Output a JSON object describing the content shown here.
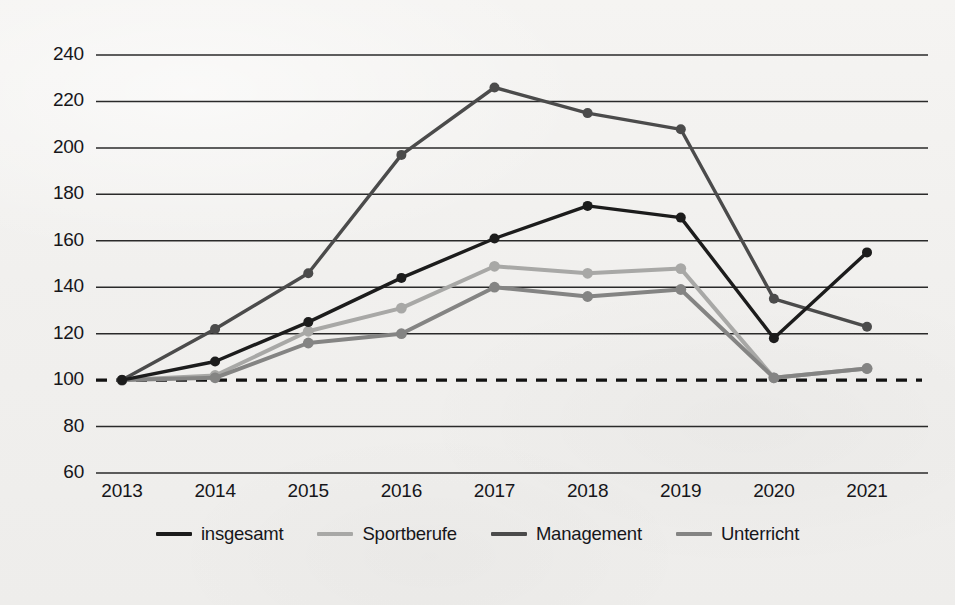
{
  "chart_data": {
    "type": "line",
    "title": "",
    "subtitle": "",
    "xlabel": "",
    "ylabel": "",
    "categories": [
      "2013",
      "2014",
      "2015",
      "2016",
      "2017",
      "2018",
      "2019",
      "2020",
      "2021"
    ],
    "ylim": [
      60,
      240
    ],
    "ytick_step": 20,
    "yticks": [
      60,
      80,
      100,
      120,
      140,
      160,
      180,
      200,
      220,
      240
    ],
    "grid": true,
    "grid_orientation": "horizontal",
    "reference_line": {
      "value": 100,
      "style": "dashed",
      "label": ""
    },
    "legend_position": "bottom",
    "series": [
      {
        "name": "insgesamt",
        "color": "#1c1c1c",
        "values": [
          100,
          108,
          125,
          144,
          161,
          175,
          170,
          118,
          155
        ]
      },
      {
        "name": "Sportberufe",
        "color": "#a8a8a6",
        "values": [
          100,
          102,
          121,
          131,
          149,
          146,
          148,
          101,
          105
        ]
      },
      {
        "name": "Management",
        "color": "#4b4b4b",
        "values": [
          100,
          122,
          146,
          197,
          226,
          215,
          208,
          135,
          123
        ]
      },
      {
        "name": "Unterricht",
        "color": "#848483",
        "values": [
          100,
          101,
          116,
          120,
          140,
          136,
          139,
          101,
          105
        ]
      }
    ]
  },
  "axis": {
    "ytick_labels": [
      "240",
      "220",
      "200",
      "180",
      "160",
      "140",
      "120",
      "100",
      "80",
      "60"
    ],
    "xtick_labels": [
      "2013",
      "2014",
      "2015",
      "2016",
      "2017",
      "2018",
      "2019",
      "2020",
      "2021"
    ]
  },
  "legend": {
    "items": [
      {
        "label": "insgesamt"
      },
      {
        "label": "Sportberufe"
      },
      {
        "label": "Management"
      },
      {
        "label": "Unterricht"
      }
    ]
  }
}
